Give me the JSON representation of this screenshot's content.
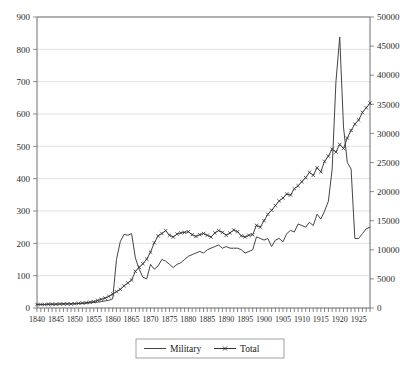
{
  "chart_data": {
    "type": "line",
    "title": "",
    "xlabel": "",
    "ylabel": "",
    "y2label": "",
    "grid": true,
    "legend_position": "bottom-center",
    "xlim": [
      1840,
      1928
    ],
    "ylim": [
      0,
      900
    ],
    "y2lim": [
      0,
      50000
    ],
    "y_ticks": [
      0,
      100,
      200,
      300,
      400,
      500,
      600,
      700,
      800,
      900
    ],
    "y2_ticks": [
      0,
      5000,
      10000,
      15000,
      20000,
      25000,
      30000,
      35000,
      40000,
      45000,
      50000
    ],
    "x_tick_labels": [
      "1840",
      "1845",
      "1850",
      "1855",
      "1860",
      "1865",
      "1870",
      "1875",
      "1880",
      "1885",
      "1890",
      "1895",
      "1900",
      "1905",
      "1910",
      "1915",
      "1920",
      "1925"
    ],
    "x_minor_tick_interval": 1,
    "x": [
      1840,
      1841,
      1842,
      1843,
      1844,
      1845,
      1846,
      1847,
      1848,
      1849,
      1850,
      1851,
      1852,
      1853,
      1854,
      1855,
      1856,
      1857,
      1858,
      1859,
      1860,
      1861,
      1862,
      1863,
      1864,
      1865,
      1866,
      1867,
      1868,
      1869,
      1870,
      1871,
      1872,
      1873,
      1874,
      1875,
      1876,
      1877,
      1878,
      1879,
      1880,
      1881,
      1882,
      1883,
      1884,
      1885,
      1886,
      1887,
      1888,
      1889,
      1890,
      1891,
      1892,
      1893,
      1894,
      1895,
      1896,
      1897,
      1898,
      1899,
      1900,
      1901,
      1902,
      1903,
      1904,
      1905,
      1906,
      1907,
      1908,
      1909,
      1910,
      1911,
      1912,
      1913,
      1914,
      1915,
      1916,
      1917,
      1918,
      1919,
      1920,
      1921,
      1922,
      1923,
      1924,
      1925,
      1926,
      1927,
      1928
    ],
    "series": [
      {
        "name": "Military",
        "axis": "left",
        "marker": "none",
        "color": "#444444",
        "values": [
          11,
          11,
          11,
          12,
          12,
          12,
          12,
          13,
          13,
          13,
          13,
          14,
          14,
          15,
          16,
          17,
          18,
          20,
          22,
          24,
          28,
          150,
          205,
          228,
          225,
          230,
          155,
          120,
          95,
          90,
          135,
          120,
          130,
          150,
          145,
          135,
          125,
          135,
          140,
          150,
          160,
          165,
          170,
          175,
          170,
          180,
          185,
          190,
          195,
          185,
          190,
          185,
          185,
          185,
          180,
          170,
          175,
          180,
          220,
          215,
          210,
          215,
          190,
          210,
          215,
          205,
          230,
          240,
          235,
          260,
          255,
          250,
          265,
          255,
          290,
          275,
          300,
          330,
          430,
          700,
          838,
          560,
          450,
          430,
          215,
          215,
          230,
          245,
          250
        ]
      },
      {
        "name": "Total",
        "axis": "right",
        "marker": "x",
        "color": "#333333",
        "values": [
          600,
          600,
          600,
          650,
          650,
          650,
          700,
          700,
          700,
          700,
          750,
          800,
          850,
          900,
          1000,
          1100,
          1300,
          1500,
          1700,
          2000,
          2400,
          2800,
          3200,
          3800,
          4300,
          4800,
          6300,
          7000,
          7600,
          8400,
          9600,
          11200,
          12400,
          12800,
          13300,
          12500,
          12200,
          12700,
          12900,
          13000,
          13100,
          12600,
          12300,
          12600,
          12800,
          12500,
          12200,
          12900,
          13300,
          13000,
          12500,
          12900,
          13400,
          13100,
          12400,
          12200,
          12500,
          12600,
          14200,
          13900,
          15000,
          16100,
          16800,
          17600,
          18400,
          18900,
          19600,
          19400,
          20500,
          21000,
          21700,
          22400,
          23300,
          22800,
          24100,
          23400,
          25200,
          26100,
          27300,
          26800,
          28100,
          27400,
          29200,
          30500,
          31600,
          32300,
          33600,
          34400,
          35200
        ]
      }
    ],
    "annotations": {
      "civil_war_peak_year": 1865,
      "wwi_peak_year": 1920,
      "wwi_peak_military_value": 838
    }
  },
  "legend": {
    "entries": [
      {
        "label": "Military",
        "style": "plain-line"
      },
      {
        "label": "Total",
        "style": "line-with-x-markers"
      }
    ]
  },
  "colors": {
    "line": "#444444",
    "grid": "#d4d4d4",
    "axis": "#6e6e6e",
    "background": "#ffffff"
  }
}
